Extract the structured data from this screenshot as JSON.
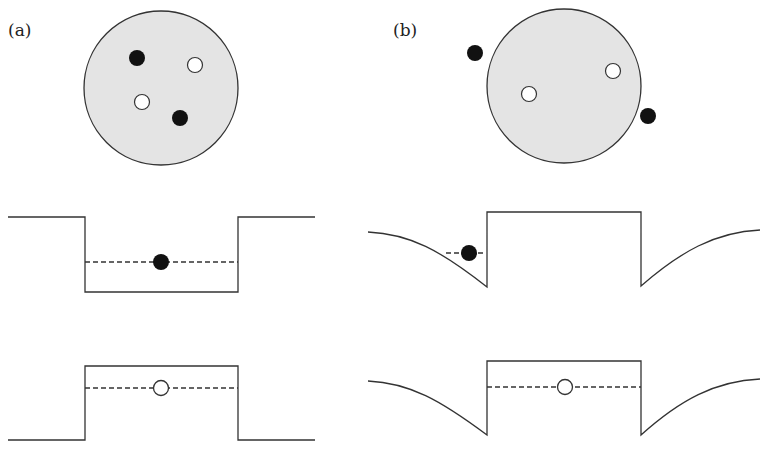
{
  "panels": [
    {
      "label": "(a)"
    },
    {
      "label": "(b)"
    }
  ],
  "colors": {
    "disk_fill": "#e4e4e4",
    "line": "#333333",
    "filled_dot": "#111111",
    "open_dot": "#ffffff"
  }
}
